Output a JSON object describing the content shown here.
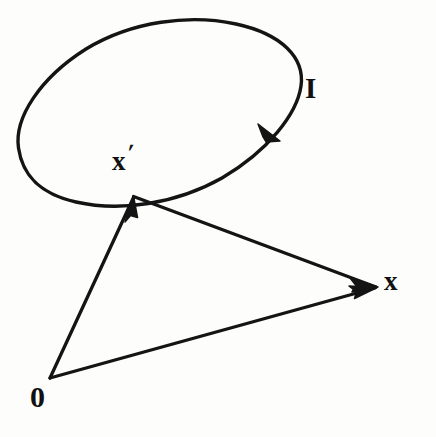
{
  "figure": {
    "background_color": "#fdfdfc",
    "ink_color": "#111111",
    "width": 436,
    "height": 437
  },
  "labels": {
    "loop": "I",
    "source_point": "x",
    "source_point_prime": "′",
    "field_point": "x",
    "origin": "0"
  },
  "chart_data": {
    "type": "diagram",
    "points": [
      {
        "name": "origin",
        "label": "0",
        "x": 50,
        "y": 378
      },
      {
        "name": "source-point",
        "label": "x′",
        "x": 133,
        "y": 197
      },
      {
        "name": "field-point",
        "label": "x",
        "x": 375,
        "y": 288
      }
    ],
    "vectors": [
      {
        "name": "origin-to-source",
        "from": "origin",
        "to": "source-point",
        "arrow_at": "to",
        "label": "x′"
      },
      {
        "name": "origin-to-field",
        "from": "origin",
        "to": "field-point",
        "arrow_at": "to",
        "label": "x"
      },
      {
        "name": "source-to-field",
        "from": "source-point",
        "to": "field-point",
        "arrow_at": "to",
        "label": ""
      }
    ],
    "loop": {
      "name": "current-loop",
      "label": "I",
      "shape": "ellipse",
      "center_x": 160,
      "center_y": 110,
      "radius_x": 146,
      "radius_y": 72,
      "rotation_deg": -19,
      "direction": "clockwise",
      "arrow_position": {
        "x": 269,
        "y": 133
      }
    },
    "axis_ranges": {
      "xlim": [
        0,
        436
      ],
      "ylim": [
        0,
        437
      ]
    },
    "grid": false,
    "legend": null
  }
}
